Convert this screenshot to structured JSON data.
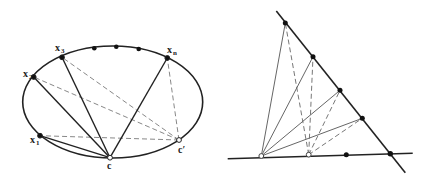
{
  "figures": [
    {
      "id": "ellipse-figure",
      "ellipse": {
        "cx": 112.7,
        "cy": 102,
        "rx": 90,
        "ry": 56
      },
      "points": [
        {
          "name": "x1",
          "label": "x",
          "sub": "1",
          "x": 40,
          "y": 135.7,
          "filled": true,
          "lx": 30,
          "ly": 143
        },
        {
          "name": "x2",
          "label": "x",
          "sub": "2",
          "x": 33.7,
          "y": 77,
          "filled": true,
          "lx": 23,
          "ly": 77
        },
        {
          "name": "x3",
          "label": "x",
          "sub": "3",
          "x": 62,
          "y": 57.3,
          "filled": true,
          "lx": 55,
          "ly": 51
        },
        {
          "name": "xn",
          "label": "x",
          "sub": "n",
          "x": 167.3,
          "y": 58,
          "filled": true,
          "lx": 167,
          "ly": 53
        },
        {
          "name": "c",
          "label": "c",
          "sub": "",
          "x": 110,
          "y": 157.7,
          "filled": false,
          "lx": 107,
          "ly": 169
        },
        {
          "name": "c-prime",
          "label": "c′",
          "sub": "",
          "x": 179,
          "y": 140,
          "filled": false,
          "lx": 178,
          "ly": 153
        }
      ],
      "extra_dots": [
        {
          "x": 94.3,
          "y": 48.3
        },
        {
          "x": 116.3,
          "y": 46.7
        },
        {
          "x": 138.7,
          "y": 49
        }
      ],
      "solid_segments_from_c": [
        "x1",
        "x2",
        "x3",
        "xn"
      ],
      "dashed_segments_from_c_prime": [
        "x1",
        "x2",
        "x3",
        "xn"
      ]
    },
    {
      "id": "lines-figure",
      "diagonal_line": {
        "x1": 276.3,
        "y1": 11,
        "x2": 405.3,
        "y2": 172.7
      },
      "base_line": {
        "x1": 227.7,
        "y1": 158.7,
        "x2": 412.7,
        "y2": 153.3
      },
      "diagonal_points": [
        {
          "x": 285.3,
          "y": 23
        },
        {
          "x": 313,
          "y": 56.7
        },
        {
          "x": 340,
          "y": 90.3
        },
        {
          "x": 362.3,
          "y": 118.3
        }
      ],
      "intersection_point": {
        "x": 390.3,
        "y": 153.7
      },
      "base_dot": {
        "x": 346.3,
        "y": 154.7
      },
      "open_points": [
        {
          "name": "p",
          "x": 261.3,
          "y": 156,
          "style": "solid"
        },
        {
          "name": "q",
          "x": 308.7,
          "y": 154.7,
          "style": "dashed"
        }
      ]
    }
  ]
}
